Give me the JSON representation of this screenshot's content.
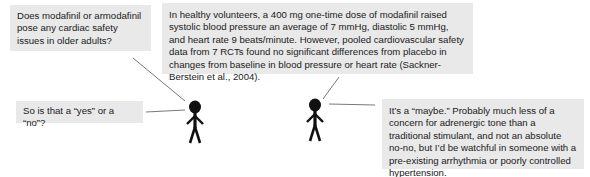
{
  "diagram": {
    "type": "conversation",
    "speakers": [
      {
        "id": "person-left",
        "role": "questioner"
      },
      {
        "id": "person-right",
        "role": "answerer"
      }
    ],
    "bubbles": [
      {
        "id": "b1",
        "speaker": "person-left",
        "text": "Does modafinil or armodafinil pose any cardiac safety issues in older adults?"
      },
      {
        "id": "b2",
        "speaker": "person-right",
        "text": "In healthy volunteers, a 400 mg one-time dose of modafinil raised systolic blood pressure an average of 7 mmHg, diastolic 5 mmHg, and heart rate 9 beats/minute. However, pooled cardiovascular safety data from 7 RCTs found no significant differences from placebo in changes from baseline in blood pressure or heart rate (Sackner-Berstein et al., 2004)."
      },
      {
        "id": "b3",
        "speaker": "person-left",
        "text": "So is that a “yes” or a “no”?"
      },
      {
        "id": "b4",
        "speaker": "person-right",
        "text": "It’s a “maybe.” Probably much less of a concern for adrenergic tone than a traditional stimulant, and not an absolute no-no, but I’d be watchful in someone with a pre-existing arrhythmia or poorly controlled hypertension."
      }
    ],
    "colors": {
      "bubble_bg": "#e9e9e9",
      "figure": "#111111",
      "connector": "#555555",
      "text": "#1a1a1a"
    }
  }
}
